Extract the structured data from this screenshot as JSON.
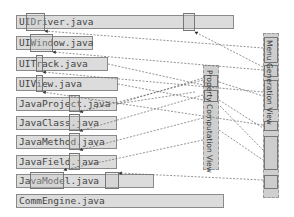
{
  "files": [
    {
      "name": "UIDriver.java"
    },
    {
      "name": "UIWindow.java"
    },
    {
      "name": "UITrack.java"
    },
    {
      "name": "UIView.java"
    },
    {
      "name": "JavaProject.java"
    },
    {
      "name": "JavaClass.java"
    },
    {
      "name": "JavaMethod.java"
    },
    {
      "name": "JavaField.java"
    },
    {
      "name": "JavaModel.java"
    },
    {
      "name": "CommEngine.java"
    }
  ],
  "views": [
    {
      "label": "Property Computation View"
    },
    {
      "label": "Menu Generation View"
    }
  ],
  "colors": {
    "box_fill": "#dcdcdc",
    "box_border": "#8a8a8a",
    "link": "#666666"
  }
}
